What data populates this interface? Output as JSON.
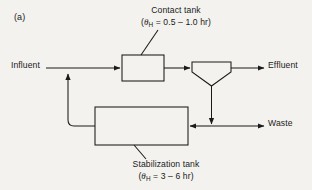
{
  "figure": {
    "panel_tag": "(a)",
    "background_color": "#f3f2ee",
    "line_color": "#1a1a1a"
  },
  "labels": {
    "influent": "Influent",
    "effluent": "Effluent",
    "waste": "Waste"
  },
  "captions": {
    "contact_tank": {
      "name": "Contact tank",
      "detention_open": "(",
      "symbol": "θ",
      "subscript": "H",
      "detention_value": " = 0.5 – 1.0 hr)"
    },
    "stabilization_tank": {
      "name": "Stabilization tank",
      "detention_open": "(",
      "symbol": "θ",
      "subscript": "H",
      "detention_value": " = 3 – 6 hr)"
    }
  },
  "nodes": {
    "contact_tank": {
      "shape": "rectangle"
    },
    "clarifier": {
      "shape": "funnel"
    },
    "stabilization_tank": {
      "shape": "rectangle"
    }
  },
  "flows": [
    {
      "name": "influent-line",
      "from": "influent",
      "to": "contact-tank"
    },
    {
      "name": "contact-to-clarifier",
      "from": "contact-tank",
      "to": "clarifier"
    },
    {
      "name": "clarifier-to-effluent",
      "from": "clarifier",
      "to": "effluent"
    },
    {
      "name": "clarifier-underflow",
      "from": "clarifier",
      "to": "waste-junction"
    },
    {
      "name": "sludge-to-stabilization",
      "from": "waste-junction",
      "to": "stabilization-tank"
    },
    {
      "name": "waste-line",
      "from": "waste-junction",
      "to": "waste"
    },
    {
      "name": "recycle-line",
      "from": "stabilization-tank",
      "to": "influent-line"
    }
  ]
}
